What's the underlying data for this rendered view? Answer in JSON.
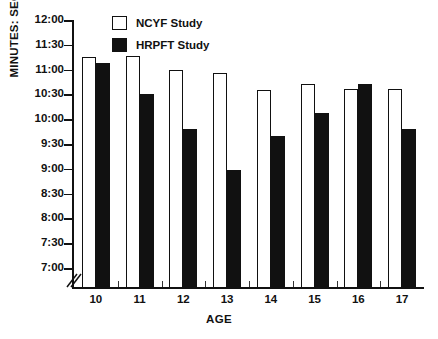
{
  "chart_data": {
    "type": "bar",
    "title": "",
    "xlabel": "AGE",
    "ylabel": "MINUTES: SECONDS",
    "categories": [
      "10",
      "11",
      "12",
      "13",
      "14",
      "15",
      "16",
      "17"
    ],
    "ytick_labels": [
      "12:00",
      "11:30",
      "11:00",
      "10:30",
      "10:00",
      "9:30",
      "9:00",
      "8:30",
      "8:00",
      "7:30",
      "7:00"
    ],
    "ylim": [
      "7:00",
      "12:00"
    ],
    "y_axis_break": true,
    "grid": false,
    "legend_position": "top-center",
    "series": [
      {
        "name": "NCYF Study",
        "color": "#ffffff",
        "edge_color": "#111111",
        "values": [
          "11:15",
          "11:16",
          "11:00",
          "10:56",
          "10:35",
          "10:43",
          "10:37",
          "10:37"
        ]
      },
      {
        "name": "HRPFT Study",
        "color": "#111111",
        "edge_color": "#111111",
        "values": [
          "11:08",
          "10:30",
          "9:48",
          "8:58",
          "9:40",
          "10:07",
          "10:42",
          "9:48"
        ]
      }
    ]
  },
  "legend": {
    "items": [
      {
        "label": "NCYF Study",
        "swatch": "white-square-icon"
      },
      {
        "label": "HRPFT Study",
        "swatch": "black-square-icon"
      }
    ]
  }
}
